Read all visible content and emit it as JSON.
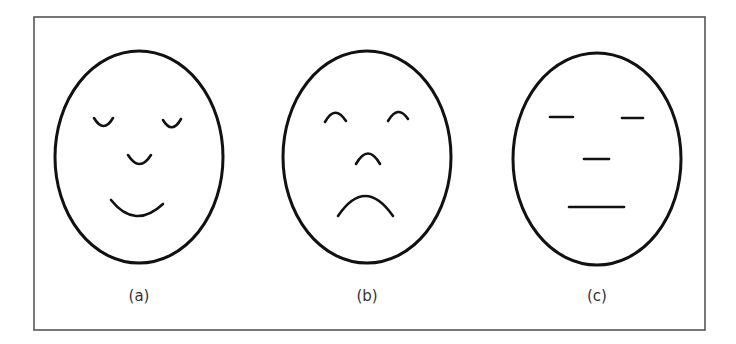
{
  "figure": {
    "background": "#ffffff",
    "frame_color": "#555555",
    "stroke_color": "#111111",
    "label_color": "#333333",
    "faces": [
      {
        "id": "a",
        "label": "(a)",
        "expression": "happy",
        "eyes": "closed-smiling",
        "nose": "cup",
        "mouth": "smile"
      },
      {
        "id": "b",
        "label": "(b)",
        "expression": "sad",
        "eyes": "arched",
        "nose": "arch",
        "mouth": "frown"
      },
      {
        "id": "c",
        "label": "(c)",
        "expression": "neutral",
        "eyes": "flat-lines",
        "nose": "flat-line",
        "mouth": "flat-line"
      }
    ]
  }
}
